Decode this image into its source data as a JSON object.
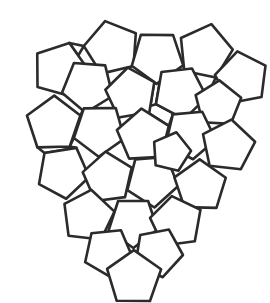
{
  "figure": {
    "tiling_type": "pentagon",
    "background_color": "#ffffff",
    "stroke_color": "#2b2b2b",
    "fill_color": "#ffffff",
    "stroke_width": 2.6,
    "canvas": {
      "width": 270,
      "height": 303
    },
    "pentagon_count": 25,
    "gap_count": 14
  },
  "chart_data": {
    "type": "diagram",
    "shapes": {
      "pentagons": [
        {
          "id": "p-top-left-outer",
          "cx": 60,
          "cy": 70,
          "r": 28,
          "rot": 18
        },
        {
          "id": "p-top-mid-left",
          "cx": 112,
          "cy": 48,
          "r": 28,
          "rot": -14
        },
        {
          "id": "p-top-center-up",
          "cx": 157,
          "cy": 57,
          "r": 27,
          "rot": 36
        },
        {
          "id": "p-top-mid-right",
          "cx": 205,
          "cy": 52,
          "r": 28,
          "rot": 12
        },
        {
          "id": "p-top-right-outer",
          "cx": 242,
          "cy": 78,
          "r": 27,
          "rot": -10
        },
        {
          "id": "p-r2-a",
          "cx": 88,
          "cy": 86,
          "r": 27,
          "rot": 40
        },
        {
          "id": "p-r2-b",
          "cx": 131,
          "cy": 94,
          "r": 26,
          "rot": -8
        },
        {
          "id": "p-r2-c",
          "cx": 180,
          "cy": 92,
          "r": 27,
          "rot": 28
        },
        {
          "id": "p-r2-d",
          "cx": 218,
          "cy": 104,
          "r": 24,
          "rot": 4
        },
        {
          "id": "p-r3-left",
          "cx": 54,
          "cy": 124,
          "r": 28,
          "rot": 0
        },
        {
          "id": "p-r3-a",
          "cx": 99,
          "cy": 130,
          "r": 27,
          "rot": 36
        },
        {
          "id": "p-r3-center",
          "cx": 143,
          "cy": 136,
          "r": 27,
          "rot": -4
        },
        {
          "id": "p-r3-b",
          "cx": 190,
          "cy": 134,
          "r": 26,
          "rot": 30
        },
        {
          "id": "p-r3-right",
          "cx": 228,
          "cy": 146,
          "r": 27,
          "rot": 8
        },
        {
          "id": "p-r4-left",
          "cx": 63,
          "cy": 172,
          "r": 27,
          "rot": 28
        },
        {
          "id": "p-r4-a",
          "cx": 108,
          "cy": 178,
          "r": 26,
          "rot": -6
        },
        {
          "id": "p-r4-center",
          "cx": 152,
          "cy": 180,
          "r": 27,
          "rot": 32
        },
        {
          "id": "p-r4-right",
          "cx": 200,
          "cy": 186,
          "r": 27,
          "rot": 0
        },
        {
          "id": "p-r5-a",
          "cx": 88,
          "cy": 216,
          "r": 27,
          "rot": 8
        },
        {
          "id": "p-r5-b",
          "cx": 133,
          "cy": 222,
          "r": 26,
          "rot": 36
        },
        {
          "id": "p-r5-c",
          "cx": 176,
          "cy": 222,
          "r": 27,
          "rot": -8
        },
        {
          "id": "p-r6-a",
          "cx": 108,
          "cy": 252,
          "r": 25,
          "rot": 30
        },
        {
          "id": "p-r6-b",
          "cx": 158,
          "cy": 252,
          "r": 25,
          "rot": 26
        },
        {
          "id": "p-bottom-apex",
          "cx": 134,
          "cy": 278,
          "r": 28,
          "rot": 0
        },
        {
          "id": "p-r4-inner-right",
          "cx": 171,
          "cy": 152,
          "r": 20,
          "rot": 14
        }
      ]
    }
  }
}
